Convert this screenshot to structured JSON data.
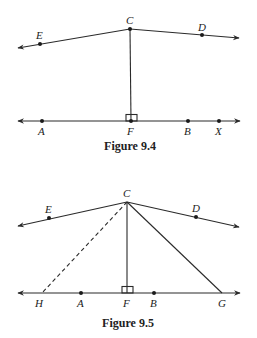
{
  "figures": [
    {
      "caption": "Figure 9.4",
      "points": {
        "C": {
          "label": "C",
          "x": 130,
          "y": 29
        },
        "E": {
          "label": "E",
          "x": 40,
          "y": 44
        },
        "D": {
          "label": "D",
          "x": 202,
          "y": 35
        },
        "A": {
          "label": "A",
          "x": 42,
          "y": 121
        },
        "F": {
          "label": "F",
          "x": 131,
          "y": 121
        },
        "B": {
          "label": "B",
          "x": 188,
          "y": 121
        },
        "X": {
          "label": "X",
          "x": 219,
          "y": 121
        }
      },
      "elements": [
        "ray CE",
        "ray CD",
        "line AX",
        "segment CF",
        "right angle at F"
      ]
    },
    {
      "caption": "Figure 9.5",
      "points": {
        "C": {
          "label": "C",
          "x": 127,
          "y": 202
        },
        "E": {
          "label": "E",
          "x": 49,
          "y": 218
        },
        "D": {
          "label": "D",
          "x": 196,
          "y": 217
        },
        "H": {
          "label": "H",
          "x": 42,
          "y": 293
        },
        "A": {
          "label": "A",
          "x": 81,
          "y": 293
        },
        "F": {
          "label": "F",
          "x": 127,
          "y": 293
        },
        "B": {
          "label": "B",
          "x": 154,
          "y": 293
        },
        "G": {
          "label": "G",
          "x": 222,
          "y": 293
        }
      },
      "elements": [
        "ray CE",
        "ray CD",
        "line HG",
        "segment CF",
        "segment CG",
        "dashed segment CH",
        "right angle at F"
      ]
    }
  ]
}
